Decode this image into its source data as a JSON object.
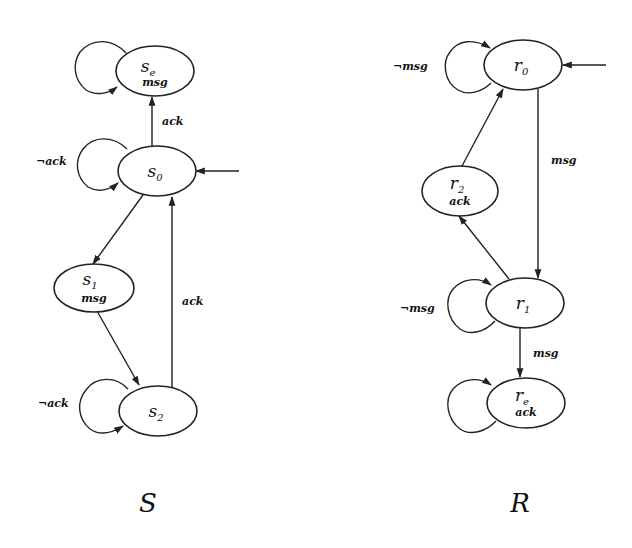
{
  "automata": [
    {
      "id": "S",
      "title": "S",
      "states": [
        {
          "id": "se",
          "name": "s",
          "sub": "e",
          "prop": "msg",
          "cx": 155,
          "cy": 71
        },
        {
          "id": "s0",
          "name": "s",
          "sub": "0",
          "prop": "",
          "cx": 155,
          "cy": 171,
          "initial": true
        },
        {
          "id": "s1",
          "name": "s",
          "sub": "1",
          "prop": "msg",
          "cx": 94,
          "cy": 290
        },
        {
          "id": "s2",
          "name": "s",
          "sub": "2",
          "prop": "",
          "cx": 158,
          "cy": 411
        }
      ],
      "transitions": [
        {
          "from": "se",
          "to": "se",
          "label": ""
        },
        {
          "from": "s0",
          "to": "se",
          "label": "ack"
        },
        {
          "from": "s0",
          "to": "s0",
          "label": "¬ack"
        },
        {
          "from": "s0",
          "to": "s1",
          "label": ""
        },
        {
          "from": "s1",
          "to": "s2",
          "label": ""
        },
        {
          "from": "s2",
          "to": "s0",
          "label": "ack"
        },
        {
          "from": "s2",
          "to": "s2",
          "label": "¬ack"
        }
      ]
    },
    {
      "id": "R",
      "title": "R",
      "states": [
        {
          "id": "r0",
          "name": "r",
          "sub": "0",
          "prop": "",
          "cx": 522,
          "cy": 65,
          "initial": true
        },
        {
          "id": "r2",
          "name": "r",
          "sub": "2",
          "prop": "ack",
          "cx": 460,
          "cy": 191
        },
        {
          "id": "r1",
          "name": "r",
          "sub": "1",
          "prop": "",
          "cx": 525,
          "cy": 303
        },
        {
          "id": "re",
          "name": "r",
          "sub": "e",
          "prop": "ack",
          "cx": 526,
          "cy": 403
        }
      ],
      "transitions": [
        {
          "from": "r0",
          "to": "r0",
          "label": "¬msg"
        },
        {
          "from": "r0",
          "to": "r1",
          "label": "msg"
        },
        {
          "from": "r1",
          "to": "r2",
          "label": ""
        },
        {
          "from": "r2",
          "to": "r0",
          "label": ""
        },
        {
          "from": "r1",
          "to": "r1",
          "label": "¬msg"
        },
        {
          "from": "r1",
          "to": "re",
          "label": "msg"
        },
        {
          "from": "re",
          "to": "re",
          "label": ""
        }
      ]
    }
  ],
  "labels": {
    "S": "S",
    "R": "R",
    "se_name": "s",
    "se_sub": "e",
    "se_prop": "msg",
    "s0_name": "s",
    "s0_sub": "0",
    "s1_name": "s",
    "s1_sub": "1",
    "s1_prop": "msg",
    "s2_name": "s",
    "s2_sub": "2",
    "r0_name": "r",
    "r0_sub": "0",
    "r2_name": "r",
    "r2_sub": "2",
    "r2_prop": "ack",
    "r1_name": "r",
    "r1_sub": "1",
    "re_name": "r",
    "re_sub": "e",
    "re_prop": "ack",
    "e_s0_se": "ack",
    "e_s0_loop": "¬ack",
    "e_s2_s0": "ack",
    "e_s2_loop": "¬ack",
    "e_r0_loop": "¬msg",
    "e_r0_r1": "msg",
    "e_r1_loop": "¬msg",
    "e_r1_re": "msg"
  }
}
